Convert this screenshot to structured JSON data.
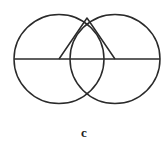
{
  "figure": {
    "caption": "c",
    "stroke_color": "#2a2a2a",
    "background": "#ffffff"
  }
}
